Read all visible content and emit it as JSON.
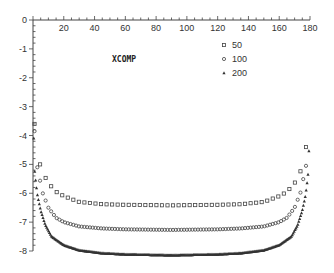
{
  "chart_data": {
    "type": "scatter",
    "title": "",
    "annotation": "XCOMP",
    "xlabel": "",
    "ylabel": "",
    "xlim": [
      0,
      180
    ],
    "ylim": [
      -8,
      0
    ],
    "x_ticks": [
      20,
      40,
      60,
      80,
      100,
      120,
      140,
      160,
      180
    ],
    "y_ticks": [
      0,
      -1,
      -2,
      -3,
      -4,
      -5,
      -6,
      -7,
      -8
    ],
    "x_axis_position": "top",
    "grid": false,
    "legend_position": "upper-right",
    "series": [
      {
        "name": "50",
        "marker": "square",
        "x": [
          1,
          3,
          5,
          8,
          10,
          15,
          20,
          30,
          45,
          60,
          90,
          120,
          135,
          150,
          160,
          165,
          170,
          172,
          175,
          177,
          179
        ],
        "y": [
          -3.6,
          -4.6,
          -5.1,
          -5.45,
          -5.65,
          -5.95,
          -6.1,
          -6.3,
          -6.38,
          -6.4,
          -6.42,
          -6.4,
          -6.38,
          -6.3,
          -6.1,
          -5.95,
          -5.65,
          -5.45,
          -5.1,
          -4.6,
          -3.6
        ]
      },
      {
        "name": "100",
        "marker": "circle",
        "x": [
          1,
          2,
          4,
          6,
          10,
          15,
          20,
          30,
          45,
          60,
          90,
          120,
          135,
          150,
          160,
          165,
          170,
          174,
          176,
          178,
          179
        ],
        "y": [
          -3.85,
          -4.9,
          -5.4,
          -5.95,
          -6.5,
          -6.85,
          -7.0,
          -7.15,
          -7.22,
          -7.25,
          -7.27,
          -7.25,
          -7.22,
          -7.15,
          -7.0,
          -6.85,
          -6.5,
          -5.95,
          -5.4,
          -4.9,
          -3.85
        ]
      },
      {
        "name": "200",
        "marker": "triangle",
        "x": [
          0.5,
          1,
          2,
          3,
          5,
          8,
          12,
          20,
          30,
          45,
          60,
          90,
          120,
          135,
          150,
          160,
          168,
          172,
          175,
          177,
          178,
          179,
          179.5
        ],
        "y": [
          -4.1,
          -5.2,
          -5.7,
          -6.1,
          -6.6,
          -7.1,
          -7.5,
          -7.8,
          -7.98,
          -8.08,
          -8.12,
          -8.15,
          -8.12,
          -8.08,
          -7.98,
          -7.8,
          -7.5,
          -7.1,
          -6.6,
          -6.1,
          -5.7,
          -5.2,
          -4.1
        ]
      }
    ]
  },
  "legend": {
    "annotation": "XCOMP",
    "items": [
      {
        "label": "50",
        "marker": "square"
      },
      {
        "label": "100",
        "marker": "circle"
      },
      {
        "label": "200",
        "marker": "triangle"
      }
    ]
  },
  "colors": {
    "ink": "#333333",
    "axis": "#444444",
    "background": "#ffffff"
  }
}
